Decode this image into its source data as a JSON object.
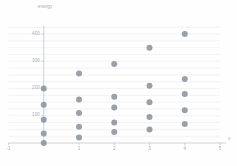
{
  "chart_data": {
    "type": "scatter",
    "title": "",
    "subtitle": "",
    "xlabel": "x",
    "ylabel": "energy",
    "xlim": [
      -1,
      5
    ],
    "ylim": [
      -20,
      430
    ],
    "grid": true,
    "grid_orientation": "horizontal",
    "legend": "none",
    "marker_color": "#8a939d",
    "gridline_color": "#eceef0",
    "axis_color": "#c2c6ca",
    "tick_label_color": "#a8aeb4",
    "xticks": [
      -1,
      1,
      2,
      3,
      4,
      5
    ],
    "xtick_labels": [
      "-1",
      "1",
      "2",
      "3",
      "4",
      "5"
    ],
    "yticks": [
      100,
      200,
      300,
      400
    ],
    "ytick_labels": [
      "100",
      "200",
      "300",
      "400"
    ],
    "points": [
      {
        "x": 0,
        "y": 0
      },
      {
        "x": 0,
        "y": 35
      },
      {
        "x": 0,
        "y": 85
      },
      {
        "x": 0,
        "y": 140
      },
      {
        "x": 0,
        "y": 200
      },
      {
        "x": 1,
        "y": 20
      },
      {
        "x": 1,
        "y": 60
      },
      {
        "x": 1,
        "y": 110
      },
      {
        "x": 1,
        "y": 160
      },
      {
        "x": 1,
        "y": 255
      },
      {
        "x": 2,
        "y": 40
      },
      {
        "x": 2,
        "y": 75
      },
      {
        "x": 2,
        "y": 130
      },
      {
        "x": 2,
        "y": 170
      },
      {
        "x": 2,
        "y": 290
      },
      {
        "x": 3,
        "y": 50
      },
      {
        "x": 3,
        "y": 95
      },
      {
        "x": 3,
        "y": 150
      },
      {
        "x": 3,
        "y": 210
      },
      {
        "x": 3,
        "y": 350
      },
      {
        "x": 4,
        "y": 70
      },
      {
        "x": 4,
        "y": 120
      },
      {
        "x": 4,
        "y": 180
      },
      {
        "x": 4,
        "y": 235
      },
      {
        "x": 4,
        "y": 400
      }
    ],
    "gridline_values": [
      25,
      50,
      75,
      100,
      125,
      150,
      175,
      200,
      225,
      250,
      275,
      300,
      325,
      350,
      375,
      400,
      425
    ]
  }
}
